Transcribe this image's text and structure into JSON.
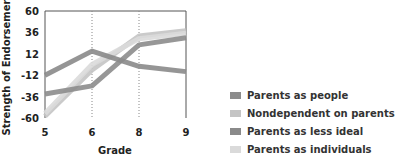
{
  "chart_data": {
    "type": "line",
    "title": "",
    "xlabel": "Grade",
    "ylabel": "Strength of Endorsement",
    "categories": [
      "5",
      "6",
      "8",
      "9"
    ],
    "yticks": [
      60,
      36,
      12,
      -12,
      -36,
      -60
    ],
    "ylim": [
      -60,
      60
    ],
    "grid": "vertical dotted at grades 6 and 8",
    "legend_position": "bottom-right",
    "series": [
      {
        "name": "Parents as people",
        "color": "#8c8c8c",
        "values": [
          -33,
          -24,
          22,
          30
        ]
      },
      {
        "name": "Nondependent on parents",
        "color": "#c4c4c4",
        "values": [
          -58,
          -6,
          32,
          38
        ]
      },
      {
        "name": "Parents as less ideal",
        "color": "#8a8a8a",
        "values": [
          -12,
          15,
          -2,
          -8
        ]
      },
      {
        "name": "Parents as individuals",
        "color": "#dadada",
        "values": [
          -55,
          0,
          29,
          35
        ]
      }
    ]
  }
}
